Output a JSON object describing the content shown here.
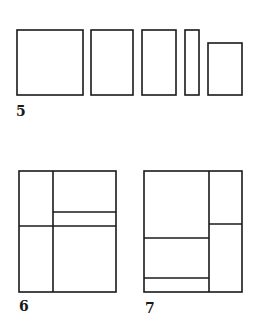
{
  "figures": [
    {
      "label": "5",
      "description": "Five separate rectangles of varying widths",
      "rects": [
        {
          "x": 17,
          "y": 30,
          "w": 66,
          "h": 65
        },
        {
          "x": 91,
          "y": 30,
          "w": 42,
          "h": 65
        },
        {
          "x": 142,
          "y": 30,
          "w": 34,
          "h": 65
        },
        {
          "x": 185,
          "y": 30,
          "w": 14,
          "h": 65
        },
        {
          "x": 208,
          "y": 43,
          "w": 34,
          "h": 52
        }
      ]
    },
    {
      "label": "6",
      "description": "Square subdivided into rectangles",
      "outer": {
        "x": 19,
        "y": 171,
        "w": 97,
        "h": 121
      },
      "lines": [
        {
          "x1": 53,
          "y1": 171,
          "x2": 53,
          "y2": 292
        },
        {
          "x1": 19,
          "y1": 226,
          "x2": 116,
          "y2": 226
        },
        {
          "x1": 53,
          "y1": 212,
          "x2": 116,
          "y2": 212
        }
      ]
    },
    {
      "label": "7",
      "description": "Square subdivided into rectangles",
      "outer": {
        "x": 144,
        "y": 171,
        "w": 98,
        "h": 121
      },
      "lines": [
        {
          "x1": 209,
          "y1": 171,
          "x2": 209,
          "y2": 292
        },
        {
          "x1": 209,
          "y1": 224,
          "x2": 242,
          "y2": 224
        },
        {
          "x1": 144,
          "y1": 238,
          "x2": 209,
          "y2": 238
        },
        {
          "x1": 144,
          "y1": 278,
          "x2": 209,
          "y2": 278
        }
      ]
    }
  ],
  "style": {
    "stroke": "#1a1a1a",
    "stroke_width": 1.6
  }
}
